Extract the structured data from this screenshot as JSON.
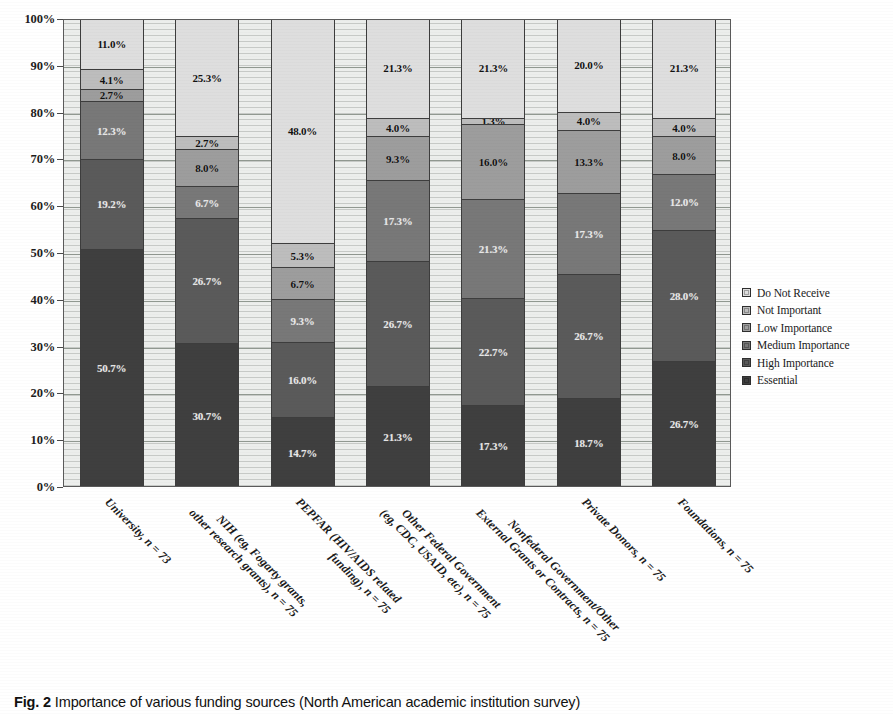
{
  "caption": {
    "figure_number": "Fig. 2",
    "text": "Importance of various funding sources (North American academic institution survey)"
  },
  "chart_data": {
    "type": "bar",
    "subtype": "stacked-100-percent",
    "title": "",
    "xlabel": "",
    "ylabel": "",
    "ylim": [
      0,
      100
    ],
    "grid": true,
    "legend_position": "right",
    "y_tick_labels": [
      "0%",
      "10%",
      "20%",
      "30%",
      "40%",
      "50%",
      "60%",
      "70%",
      "80%",
      "90%",
      "100%"
    ],
    "y_tick_values": [
      0,
      10,
      20,
      30,
      40,
      50,
      60,
      70,
      80,
      90,
      100
    ],
    "categories": [
      {
        "line1": "University, n = 73",
        "line2": "",
        "n": 73
      },
      {
        "line1": "NIH (eg, Fogarty grants,",
        "line2": "other research grants), n = 75",
        "n": 75
      },
      {
        "line1": "PEPFAR (HIV/AIDS related",
        "line2": "funding), n = 75",
        "n": 75
      },
      {
        "line1": "Other Federal Government",
        "line2": "(eg, CDC, USAID, etc), n = 75",
        "n": 75
      },
      {
        "line1": "Nonfederal Government/Other",
        "line2": "External Grants or Contracts, n = 75",
        "n": 75
      },
      {
        "line1": "Private Donors, n = 75",
        "line2": "",
        "n": 75
      },
      {
        "line1": "Foundations, n = 75",
        "line2": "",
        "n": 75
      }
    ],
    "series": [
      {
        "name": "Essential",
        "color": "#3f3f3f",
        "text_tone": "dark",
        "values": [
          50.7,
          30.7,
          14.7,
          21.3,
          17.3,
          18.7,
          26.7
        ]
      },
      {
        "name": "High Importance",
        "color": "#5a5a5a",
        "text_tone": "dark",
        "values": [
          19.2,
          26.7,
          16.0,
          26.7,
          22.7,
          26.7,
          28.0
        ]
      },
      {
        "name": "Medium Importance",
        "color": "#787878",
        "text_tone": "dark",
        "values": [
          12.3,
          6.7,
          9.3,
          17.3,
          21.3,
          17.3,
          12.0
        ]
      },
      {
        "name": "Low Importance",
        "color": "#9d9d9d",
        "text_tone": "light",
        "values": [
          2.7,
          8.0,
          6.7,
          9.3,
          16.0,
          13.3,
          8.0
        ]
      },
      {
        "name": "Not Important",
        "color": "#bdbdbd",
        "text_tone": "light",
        "values": [
          4.1,
          2.7,
          5.3,
          4.0,
          1.3,
          4.0,
          4.0
        ]
      },
      {
        "name": "Do Not Receive",
        "color": "#dedede",
        "text_tone": "light",
        "values": [
          11.0,
          25.3,
          48.0,
          21.3,
          21.3,
          20.0,
          21.3
        ]
      }
    ],
    "legend_order": [
      "Do Not Receive",
      "Not Important",
      "Low Importance",
      "Medium Importance",
      "High Importance",
      "Essential"
    ],
    "data_labels": [
      {
        "category": "University, n = 73",
        "labels": [
          "50.7%",
          "19.2%",
          "12.3%",
          "2.7%",
          "4.1%",
          "11.0%"
        ]
      },
      {
        "category": "NIH (eg, Fogarty grants, other research grants), n = 75",
        "labels": [
          "30.7%",
          "26.7%",
          "6.7%",
          "8.0%",
          "2.7%",
          "25.3%"
        ]
      },
      {
        "category": "PEPFAR (HIV/AIDS related funding), n = 75",
        "labels": [
          "14.7%",
          "16.0%",
          "9.3%",
          "6.7%",
          "5.3%",
          "48.0%"
        ]
      },
      {
        "category": "Other Federal Government (eg, CDC, USAID, etc), n = 75",
        "labels": [
          "21.3%",
          "26.7%",
          "17.3%",
          "9.3%",
          "4.0%",
          "21.3%"
        ]
      },
      {
        "category": "Nonfederal Government/Other External Grants or Contracts, n = 75",
        "labels": [
          "17.3%",
          "22.7%",
          "21.3%",
          "16.0%",
          "1.3%",
          "21.3%"
        ]
      },
      {
        "category": "Private Donors, n = 75",
        "labels": [
          "18.7%",
          "26.7%",
          "17.3%",
          "13.3%",
          "4.0%",
          "20.0%"
        ]
      },
      {
        "category": "Foundations, n = 75",
        "labels": [
          "26.7%",
          "28.0%",
          "12.0%",
          "8.0%",
          "4.0%",
          "21.3%"
        ]
      }
    ]
  }
}
